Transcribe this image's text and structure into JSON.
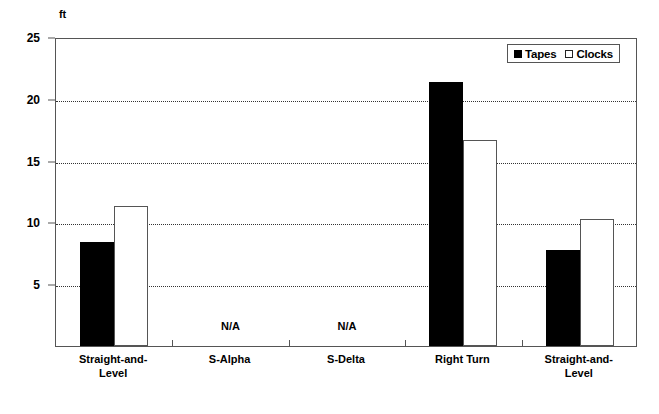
{
  "chart_data": {
    "type": "bar",
    "title": "",
    "subtitle": "",
    "xlabel": "",
    "ylabel": "ft",
    "unit_label": "ft",
    "ylim": [
      0,
      25
    ],
    "yticks": [
      5,
      10,
      15,
      20,
      25
    ],
    "ytick_labels": [
      "5",
      "10",
      "15",
      "20",
      "25"
    ],
    "grid": true,
    "grid_style": "dotted-horizontal",
    "legend_position": "top-right",
    "legend": [
      "Tapes",
      "Clocks"
    ],
    "categories": [
      "Straight-and-\nLevel",
      "S-Alpha",
      "S-Delta",
      "Right Turn",
      "Straight-and-\nLevel"
    ],
    "series": [
      {
        "name": "Tapes",
        "color": "#000000",
        "fill": "solid",
        "values": [
          8.4,
          null,
          null,
          21.4,
          7.8
        ],
        "value_labels": [
          "8.4",
          "N/A",
          "N/A",
          "21.4",
          "7.8"
        ]
      },
      {
        "name": "Clocks",
        "color": "#ffffff",
        "fill": "hollow",
        "values": [
          11.3,
          null,
          null,
          16.7,
          10.3
        ],
        "value_labels": [
          "11.3",
          "N/A",
          "N/A",
          "16.7",
          "10.3"
        ]
      }
    ],
    "missing_marker": "N/A",
    "missing_categories": [
      "S-Alpha",
      "S-Delta"
    ]
  },
  "colors": {
    "tapes": "#000000",
    "clocks": "#ffffff",
    "frame": "#555555",
    "grid": "#333333",
    "background": "#ffffff"
  }
}
